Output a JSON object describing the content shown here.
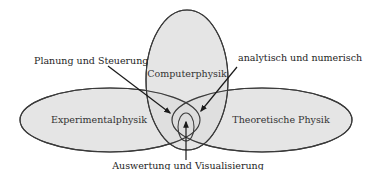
{
  "diagram": {
    "type": "venn",
    "sets": [
      {
        "id": "experimental",
        "label": "Experimentalphysik"
      },
      {
        "id": "computer",
        "label": "Computerphysik"
      },
      {
        "id": "theoretical",
        "label": "Theoretische Physik"
      }
    ],
    "annotations": [
      {
        "id": "planning",
        "label": "Planung und Steuerung",
        "points_to": "Experimentalphysik ∩ Computerphysik"
      },
      {
        "id": "analytical",
        "label": "analytisch und numerisch",
        "points_to": "Computerphysik ∩ Theoretische Physik"
      },
      {
        "id": "evaluation",
        "label": "Auswertung und Visualisierung",
        "points_to": "Experimentalphysik ∩ Computerphysik ∩ Theoretische Physik"
      }
    ],
    "colors": {
      "fill": "#dcdcdc",
      "stroke": "#3a3a3a",
      "text": "#1e1e1e"
    }
  }
}
